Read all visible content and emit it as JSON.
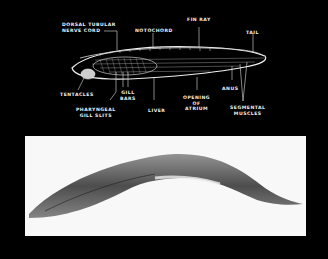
{
  "figure": {
    "diagram": {
      "labels": {
        "dorsal_nerve_cord": "DORSAL TUBULAR\nNERVE CORD",
        "notochord": "NOTOCHORD",
        "fin_ray": "FIN RAY",
        "tail": "TAIL",
        "tentacles": "TENTACLES",
        "gill_bars": "GILL\nBARS",
        "pharyngeal_gill_slits": "PHARYNGEAL\nGILL SLITS",
        "liver": "LIVER",
        "opening_of_atrium": "OPENING\nOF\nATRIUM",
        "anus": "ANUS",
        "segmental_muscles": "SEGMENTAL\nMUSCLES"
      }
    },
    "photo": {
      "description": "Photograph of a lancelet specimen"
    }
  }
}
